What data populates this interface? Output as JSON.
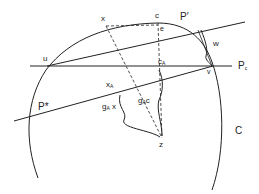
{
  "diagram": {
    "type": "geometric construction",
    "labels": {
      "x": "x",
      "c": "c",
      "e": "e",
      "p_prime": "P′",
      "u": "u",
      "w": "w",
      "v": "v",
      "p_c_main": "P",
      "p_c_sub": "c",
      "c_a_main": "c",
      "c_a_sub": "A",
      "x_a_main": "x",
      "x_a_sub": "A",
      "p_star": "P*",
      "ga_c_main": "g",
      "ga_c_sub": "A",
      "ga_c_arg": "c",
      "ga_x_main": "g",
      "ga_x_sub": "A",
      "ga_x_arg": "x",
      "z": "z",
      "circle": "C"
    },
    "stroke_color": "#222222"
  }
}
